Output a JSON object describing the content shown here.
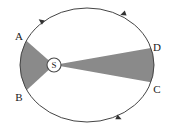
{
  "figure": {
    "background_color": "#ffffff",
    "orbit": {
      "shape": "ellipse",
      "center_x": 87,
      "center_y": 65,
      "radius_x": 67,
      "radius_y": 57,
      "stroke_color": "#444444",
      "stroke_width": 1,
      "fill": "none",
      "direction": "counterclockwise"
    },
    "focus": {
      "name": "S",
      "label": "S",
      "x": 54,
      "y": 65,
      "marker_radius": 7,
      "marker_fill": "#ffffff",
      "marker_stroke": "#4a4a4a"
    },
    "sector_fill_color": "#8a8a8a",
    "sectors": [
      {
        "name": "sector-ASB",
        "label": "A-S-B",
        "from_point": "A",
        "to_point": "B",
        "fill": "#8a8a8a"
      },
      {
        "name": "sector-DSC",
        "label": "D-S-C",
        "from_point": "D",
        "to_point": "C",
        "fill": "#8a8a8a"
      }
    ],
    "points": [
      {
        "id": "A",
        "label": "A",
        "x": 27,
        "y": 41,
        "label_x": 19,
        "label_y": 36
      },
      {
        "id": "B",
        "label": "B",
        "x": 27,
        "y": 90,
        "label_x": 19,
        "label_y": 97
      },
      {
        "id": "C",
        "label": "C",
        "x": 150,
        "y": 82,
        "label_x": 157,
        "label_y": 89
      },
      {
        "id": "D",
        "label": "D",
        "x": 151,
        "y": 48,
        "label_x": 157,
        "label_y": 47
      }
    ],
    "arrows": [
      {
        "name": "arrow-top-left",
        "x": 41,
        "y": 21,
        "angle": -145
      },
      {
        "name": "arrow-top-right",
        "x": 123,
        "y": 14,
        "angle": 160
      },
      {
        "name": "arrow-bottom",
        "x": 119,
        "y": 118,
        "angle": 25
      }
    ]
  }
}
